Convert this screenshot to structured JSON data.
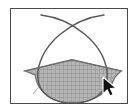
{
  "window": {
    "background_color": "#ffffff"
  },
  "canvas": {
    "name": "geometry-canvas",
    "border_color": "#4a4a4a",
    "fill_color": "#ffffff",
    "left": 10,
    "top": 8,
    "width": 118,
    "height": 96
  },
  "figure": {
    "stroke_color": "#5a5a5a",
    "stroke_width": 1.4,
    "mesh_line_color": "#8f8f8f",
    "mesh_fill_color": "#b5b5b5",
    "mesh_cell_size": 4,
    "elements": [
      {
        "name": "arc-left",
        "type": "arc",
        "description": "left arc sweeping from upper-left down and around to the right",
        "path": "M 30 6 C 62 10, 92 34, 96 62 C 99 86, 78 94, 59 94"
      },
      {
        "name": "arc-right",
        "type": "arc",
        "description": "right arc sweeping from upper-right down and around to the left",
        "path": "M 93 6 C 61 10, 31 34, 27 62 C 24 86, 45 94, 64 94"
      },
      {
        "name": "chord-line-left",
        "type": "line",
        "description": "left half of the shallow tent chord, extends past the outline",
        "x1": 14,
        "y1": 62,
        "x2": 61,
        "y2": 51
      },
      {
        "name": "chord-line-right",
        "type": "line",
        "description": "right half of the shallow tent chord, extends past the outline",
        "x1": 61,
        "y1": 51,
        "x2": 110,
        "y2": 62
      },
      {
        "name": "tangent-line",
        "type": "line",
        "description": "faint diagonal tangent crossing the lower-left of the shape",
        "x1": 22,
        "y1": 84,
        "x2": 46,
        "y2": 57
      },
      {
        "name": "shaded-segment",
        "type": "filled-region",
        "description": "mesh-filled region between the tent chord and the bottom of the oval",
        "path": "M 14 62 L 61 51 L 110 62 L 104 68 C 97 87, 76 95, 58 94 C 40 93, 26 82, 24 66 Z"
      }
    ]
  },
  "cursor": {
    "name": "mouse-pointer",
    "x": 104,
    "y": 79,
    "fill_color": "#111111",
    "outline_color": "#ffffff",
    "shape": "arrow-pointer"
  }
}
